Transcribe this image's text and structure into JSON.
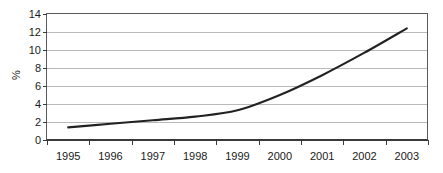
{
  "chart_data": {
    "type": "line",
    "title": "",
    "subtitle": "",
    "xlabel": "",
    "ylabel": "%",
    "categories": [
      "1995",
      "1996",
      "1997",
      "1998",
      "1999",
      "2000",
      "2001",
      "2002",
      "2003"
    ],
    "x": [
      1995,
      1996,
      1997,
      1998,
      1999,
      2000,
      2001,
      2002,
      2003
    ],
    "values": [
      1.4,
      1.8,
      2.2,
      2.6,
      3.3,
      5.0,
      7.2,
      9.7,
      12.4
    ],
    "series": [
      {
        "name": "percent",
        "values": [
          1.4,
          1.8,
          2.2,
          2.6,
          3.3,
          5.0,
          7.2,
          9.7,
          12.4
        ],
        "color": "#222222"
      }
    ],
    "ylim": [
      0,
      14
    ],
    "yticks": [
      0,
      2,
      4,
      6,
      8,
      10,
      12,
      14
    ],
    "ytick_labels": [
      "0",
      "2",
      "4",
      "6",
      "8",
      "10",
      "12",
      "14"
    ],
    "xtick_labels": [
      "1995",
      "1996",
      "1997",
      "1998",
      "1999",
      "2000",
      "2001",
      "2002",
      "2003"
    ],
    "grid": true,
    "grid_axis": "y",
    "legend": false,
    "legend_position": "none",
    "annotations": []
  },
  "axes": {
    "y_label_text": "%",
    "y_ticks": [
      {
        "value": 14,
        "label": "14"
      },
      {
        "value": 12,
        "label": "12"
      },
      {
        "value": 10,
        "label": "10"
      },
      {
        "value": 8,
        "label": "8"
      },
      {
        "value": 6,
        "label": "6"
      },
      {
        "value": 4,
        "label": "4"
      },
      {
        "value": 2,
        "label": "2"
      },
      {
        "value": 0,
        "label": "0"
      }
    ],
    "x_ticks": [
      {
        "label": "1995"
      },
      {
        "label": "1996"
      },
      {
        "label": "1997"
      },
      {
        "label": "1998"
      },
      {
        "label": "1999"
      },
      {
        "label": "2000"
      },
      {
        "label": "2001"
      },
      {
        "label": "2002"
      },
      {
        "label": "2003"
      }
    ]
  },
  "style": {
    "series_color": "#222222",
    "grid_color": "#b9b9b9",
    "border_color": "#5a5a5a",
    "axis_color": "#3a3a3a",
    "text_color": "#1a1a1a",
    "background": "#ffffff"
  }
}
